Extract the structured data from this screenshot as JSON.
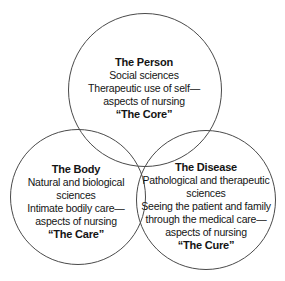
{
  "diagram": {
    "type": "venn-3",
    "background": "#ffffff",
    "stroke_color": "#4a4a4a",
    "text_color": "#141414",
    "circles": [
      {
        "id": "person",
        "title": "The Person",
        "lines": [
          "Social sciences",
          "Therapeutic use of self—",
          "aspects of nursing"
        ],
        "tagline": "“The Core”"
      },
      {
        "id": "body",
        "title": "The Body",
        "lines": [
          "Natural and biological",
          "sciences",
          "Intimate bodily care—",
          "aspects of nursing"
        ],
        "tagline": "“The Care”"
      },
      {
        "id": "disease",
        "title": "The Disease",
        "lines": [
          "Pathological and therapeutic",
          "sciences",
          "Seeing the patient and family",
          "through the medical care—",
          "aspects of nursing"
        ],
        "tagline": "“The Cure”"
      }
    ]
  }
}
